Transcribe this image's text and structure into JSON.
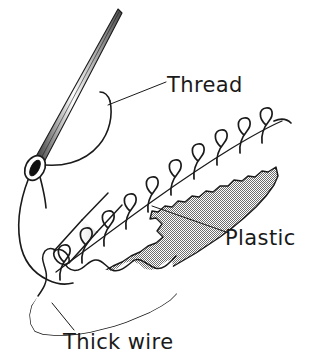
{
  "figure": {
    "background_color": "#ffffff",
    "ink_color": "#1a1a1a",
    "plastic_fill_color": "#9a9a9a",
    "width": 309,
    "height": 357
  },
  "labels": {
    "thread": "Thread",
    "plastic": "Plastic",
    "thick_wire": "Thick wire"
  },
  "parts": {
    "needle": "sewing-needle",
    "needle_eye": "needle-eye",
    "thread_loop": "thread-loop",
    "stitch_line": "stitch-seam-line",
    "stitches": "whip-stitch-loops",
    "plastic_sheet": "plastic-sheet",
    "wire": "thick-wire-cylinder"
  },
  "leaders": {
    "thread_leader": "thread-leader-line",
    "plastic_leader": "plastic-leader-line",
    "wire_leader": "thick-wire-leader-line"
  }
}
